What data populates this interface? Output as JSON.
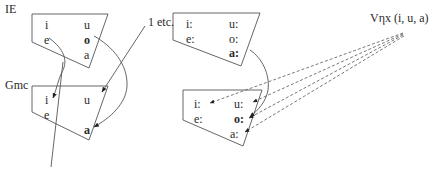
{
  "diagram": {
    "left_group": {
      "ie_label": "IE",
      "gmc_label": "Gmc",
      "annotation": "1 etc.",
      "ie_vowels": [
        {
          "symbol": "i",
          "bold": false
        },
        {
          "symbol": "u",
          "bold": false
        },
        {
          "symbol": "e",
          "bold": false
        },
        {
          "symbol": "o",
          "bold": true
        },
        {
          "symbol": "a",
          "bold": false
        }
      ],
      "gmc_vowels": [
        {
          "symbol": "i",
          "bold": false
        },
        {
          "symbol": "u",
          "bold": false
        },
        {
          "symbol": "e",
          "bold": false
        },
        {
          "symbol": "a",
          "bold": true
        }
      ],
      "arrows": [
        {
          "from": "IE e",
          "to": "Gmc i",
          "style": "solid-curve"
        },
        {
          "from": "IE o",
          "to": "Gmc a",
          "style": "solid-curve"
        },
        {
          "from": "1 etc.",
          "to": "Gmc u",
          "style": "solid-line"
        }
      ]
    },
    "right_group": {
      "source_label": "Vηx (i, u, a)",
      "top_vowels": [
        {
          "symbol": "i:",
          "bold": false
        },
        {
          "symbol": "u:",
          "bold": false
        },
        {
          "symbol": "e:",
          "bold": false
        },
        {
          "symbol": "o:",
          "bold": false
        },
        {
          "symbol": "a:",
          "bold": true
        }
      ],
      "bottom_vowels": [
        {
          "symbol": "i:",
          "bold": false
        },
        {
          "symbol": "u:",
          "bold": false
        },
        {
          "symbol": "e:",
          "bold": false
        },
        {
          "symbol": "o:",
          "bold": true
        },
        {
          "symbol": "a:",
          "bold": false
        }
      ],
      "arrows": [
        {
          "from": "top a:",
          "to": "bottom o:",
          "style": "solid-curve"
        },
        {
          "from": "Vηx",
          "to": "bottom i:",
          "style": "dashed"
        },
        {
          "from": "Vηx",
          "to": "bottom u:",
          "style": "dashed"
        },
        {
          "from": "Vηx",
          "to": "bottom o:",
          "style": "dashed"
        },
        {
          "from": "Vηx",
          "to": "bottom a:",
          "style": "dashed"
        }
      ]
    },
    "colors": {
      "ink": "#2a2a2a",
      "line": "#555555",
      "background": "#ffffff"
    },
    "clipped_caption": "· · · · ·   ·   ·  · · · · · ·  · · ·   · · · · ·  · · · · · ·"
  }
}
